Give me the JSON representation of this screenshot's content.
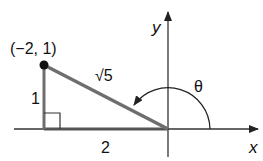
{
  "diagram": {
    "type": "coordinate-triangle",
    "axes": {
      "x_label": "x",
      "y_label": "y"
    },
    "point": {
      "label": "(−2, 1)",
      "x": -2,
      "y": 1
    },
    "sides": {
      "vertical": "1",
      "horizontal": "2",
      "hypotenuse": "√5"
    },
    "angle": {
      "label": "θ",
      "direction": "counterclockwise from positive x-axis"
    },
    "colors": {
      "axis": "#333333",
      "triangle": "#6e6e6e",
      "point": "#111111",
      "text": "#111111"
    }
  }
}
